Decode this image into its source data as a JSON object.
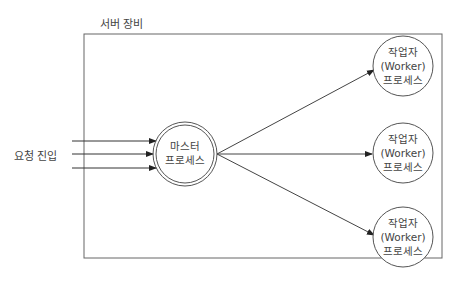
{
  "diagram": {
    "container_label": "서버 장비",
    "input_label": "요청 진입",
    "master": {
      "line1": "마스터",
      "line2": "프로세스"
    },
    "workers": [
      {
        "line1": "작업자",
        "line2": "(Worker)",
        "line3": "프로세스"
      },
      {
        "line1": "작업자",
        "line2": "(Worker)",
        "line3": "프로세스"
      },
      {
        "line1": "작업자",
        "line2": "(Worker)",
        "line3": "프로세스"
      }
    ],
    "colors": {
      "stroke": "#555555",
      "text": "#444444",
      "background": "#ffffff"
    }
  }
}
